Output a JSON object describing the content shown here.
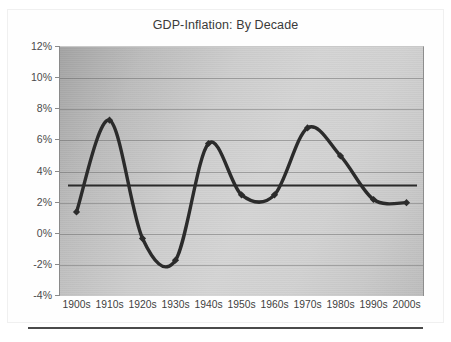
{
  "chart_data": {
    "type": "line",
    "title": "GDP-Inflation: By Decade",
    "xlabel": "",
    "ylabel": "",
    "categories": [
      "1900s",
      "1910s",
      "1920s",
      "1930s",
      "1940s",
      "1950s",
      "1960s",
      "1970s",
      "1980s",
      "1990s",
      "2000s"
    ],
    "series": [
      {
        "name": "GDP-Inflation",
        "values": [
          1.4,
          7.3,
          -0.3,
          -1.7,
          5.8,
          2.5,
          2.5,
          6.8,
          5.0,
          2.2,
          2.0
        ],
        "marker": "diamond",
        "smoothing": "spline",
        "color": "#2b2b2b"
      },
      {
        "name": "Average",
        "type": "reference-line",
        "value": 3.1,
        "color": "#2b2b2b"
      }
    ],
    "ylim": [
      -4,
      12
    ],
    "ytick_step": 2,
    "ytick_labels": [
      "12%",
      "10%",
      "8%",
      "6%",
      "4%",
      "2%",
      "0%",
      "-2%",
      "-4%"
    ],
    "ytick_values": [
      12,
      10,
      8,
      6,
      4,
      2,
      0,
      -2,
      -4
    ],
    "grid": true,
    "grid_axis": "y",
    "legend": "none",
    "plot_background": "gray-gradient"
  },
  "figure": {
    "title": "GDP-Inflation: By Decade"
  }
}
